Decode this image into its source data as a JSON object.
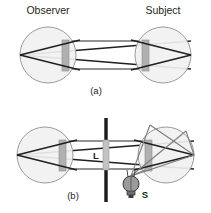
{
  "figure": {
    "caption_a": "(a)",
    "caption_b": "(b)",
    "labels": {
      "observer": "Observer",
      "subject": "Subject",
      "lens": "L",
      "source": "S"
    },
    "colors": {
      "ink": "#231f20",
      "eye_fill": "#f2f2f2",
      "eye_stroke": "#9a9a9a",
      "lens_fill": "#b5b5b5",
      "lens_stroke": "#8d8d8d",
      "ray_dark": "#231f20",
      "ray_light": "#7d7d7d",
      "bar": "#1a1a1a",
      "bulb_fill": "#9b9b9b",
      "bulb_stroke": "#3a3a3a",
      "background": "#ffffff"
    },
    "panels": [
      {
        "id": "panel-a",
        "caption": "(a)",
        "headings": [
          "Observer",
          "Subject"
        ],
        "elements": [
          "observer-eye",
          "subject-eye",
          "observer-lens",
          "subject-lens",
          "ray-bundle-horizontal"
        ]
      },
      {
        "id": "panel-b",
        "caption": "(b)",
        "headings": [],
        "elements": [
          "observer-eye",
          "subject-eye",
          "observer-lens",
          "subject-lens",
          "beamsplitter-bar",
          "lens-L",
          "light-source-S",
          "ray-bundle-horizontal",
          "ray-bundle-source"
        ]
      }
    ]
  },
  "geometry": {
    "panel_a": {
      "left_eye": {
        "cx": 48,
        "cy": 55,
        "r": 28
      },
      "right_eye": {
        "cx": 163,
        "cy": 55,
        "r": 28
      },
      "left_lens": {
        "x": 62,
        "y": 39,
        "w": 7,
        "h": 32
      },
      "right_lens": {
        "x": 142,
        "y": 39,
        "w": 7,
        "h": 32
      },
      "left_apex": {
        "x": 20,
        "y": 55
      },
      "right_apex": {
        "x": 191,
        "y": 55
      },
      "beam_top_y": 41,
      "beam_bottom_y": 69
    },
    "panel_b": {
      "left_eye": {
        "cx": 45,
        "cy": 155,
        "r": 28
      },
      "right_eye": {
        "cx": 166,
        "cy": 155,
        "r": 28
      },
      "left_lens": {
        "x": 59,
        "y": 139,
        "w": 7,
        "h": 32
      },
      "right_lens": {
        "x": 145,
        "y": 139,
        "w": 7,
        "h": 32
      },
      "left_apex": {
        "x": 17,
        "y": 155
      },
      "right_apex": {
        "x": 194,
        "y": 155
      },
      "bar_x": 106,
      "bar_top": 118,
      "bar_bottom": 202,
      "splitter_lens": {
        "x": 103,
        "y": 139,
        "w": 6,
        "h": 30
      },
      "bulb": {
        "cx": 131,
        "cy": 184,
        "r": 8
      },
      "beam_top_y": 141,
      "beam_bottom_y": 169
    }
  }
}
